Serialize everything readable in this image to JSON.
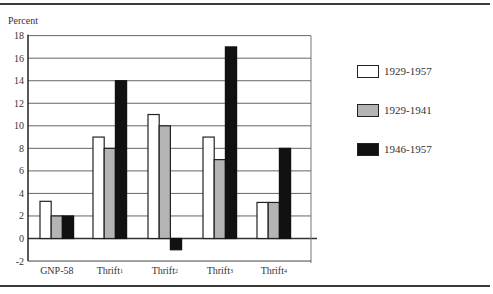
{
  "chart_data": {
    "type": "bar",
    "title": "",
    "xlabel": "",
    "ylabel": "Percent",
    "ylim": [
      -2,
      18
    ],
    "yticks": [
      -2,
      0,
      2,
      4,
      6,
      8,
      10,
      12,
      14,
      16,
      18
    ],
    "grid": true,
    "legend_position": "right",
    "categories": [
      "GNP-58",
      "Thrift1",
      "Thrift2",
      "Thrift3",
      "Thrift4"
    ],
    "category_labels": [
      {
        "base": "GNP-58",
        "sup": ""
      },
      {
        "base": "Thrift",
        "sup": "1"
      },
      {
        "base": "Thrift",
        "sup": "2"
      },
      {
        "base": "Thrift",
        "sup": "3"
      },
      {
        "base": "Thrift",
        "sup": "4"
      }
    ],
    "series": [
      {
        "name": "1929-1957",
        "color": "#ffffff",
        "values": [
          3.3,
          9,
          11,
          9,
          3.2
        ]
      },
      {
        "name": "1929-1941",
        "color": "#b4b4b4",
        "values": [
          2,
          8,
          10,
          7,
          3.2
        ]
      },
      {
        "name": "1946-1957",
        "color": "#111111",
        "values": [
          2,
          14,
          -1,
          17,
          8
        ]
      }
    ]
  },
  "legend": [
    {
      "label": "1929-1957",
      "color": "#ffffff"
    },
    {
      "label": "1929-1941",
      "color": "#b4b4b4"
    },
    {
      "label": "1946-1957",
      "color": "#111111"
    }
  ]
}
